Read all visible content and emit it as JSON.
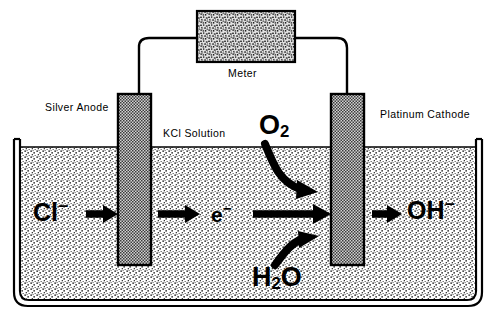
{
  "diagram": {
    "type": "schematic",
    "background_color": "#ffffff",
    "ink_color": "#000000"
  },
  "meter": {
    "label": "Meter",
    "fill_style": "speckled-noise",
    "fill_color": "#b4b4b4"
  },
  "electrodes": [
    {
      "id": "anode",
      "label": "Silver Anode",
      "material": "silver",
      "fill_style": "checker-halftone",
      "fill_color": "#8c8c8c"
    },
    {
      "id": "cathode",
      "label": "Platinum Cathode",
      "material": "platinum",
      "fill_style": "checker-halftone",
      "fill_color": "#8c8c8c"
    }
  ],
  "solution": {
    "label": "KCl Solution",
    "fill_style": "stipple-dots",
    "fill_color": "#e8e8e8"
  },
  "species": {
    "chloride": {
      "symbol": "Cl",
      "charge": "−",
      "label": "Cl⁻"
    },
    "electron": {
      "symbol": "e",
      "charge": "−",
      "label": "e⁻"
    },
    "oxygen": {
      "symbol": "O",
      "subscript": "2",
      "label": "O₂"
    },
    "water": {
      "symbol": "H",
      "subscript": "2",
      "symbol2": "O",
      "label": "H₂O"
    },
    "hydroxide": {
      "symbol": "OH",
      "charge": "−",
      "label": "OH⁻"
    }
  },
  "flows": [
    {
      "from": "chloride",
      "to": "anode",
      "style": "straight-arrow"
    },
    {
      "from": "anode",
      "to": "electron",
      "style": "straight-arrow"
    },
    {
      "from": "electron",
      "to": "cathode",
      "style": "straight-arrow"
    },
    {
      "from": "oxygen",
      "to": "cathode",
      "style": "curved-arrow"
    },
    {
      "from": "water",
      "to": "cathode",
      "style": "curved-arrow"
    },
    {
      "from": "cathode",
      "to": "hydroxide",
      "style": "straight-arrow"
    }
  ]
}
